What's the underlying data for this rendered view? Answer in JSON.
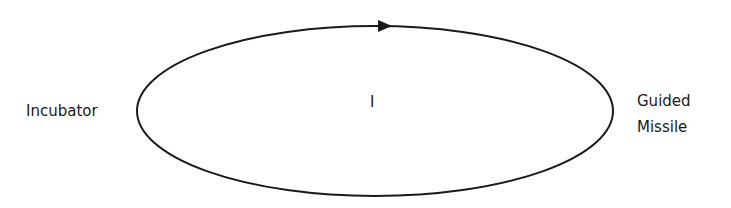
{
  "diagram": {
    "left_label": "Incubator",
    "center_label": "I",
    "right_label_line1": "Guided",
    "right_label_line2": "Missile",
    "stroke_color": "#1a1a1a",
    "arrow_direction": "clockwise"
  }
}
